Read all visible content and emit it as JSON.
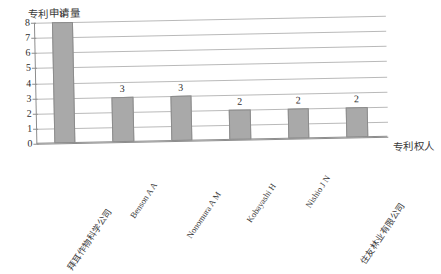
{
  "chart_data": {
    "type": "bar",
    "title": "",
    "ylabel": "专利申请量",
    "xlabel": "专利权人",
    "categories": [
      "拜耳作物科学公司",
      "Benson A A",
      "Nonomura A M",
      "Kobayashi H",
      "Nishio J N",
      "住友林业有限公司"
    ],
    "values": [
      8,
      3,
      3,
      2,
      2,
      2
    ],
    "value_labels": [
      "8",
      "3",
      "3",
      "2",
      "2",
      "2"
    ],
    "ylim": [
      0,
      8
    ],
    "yticks": [
      "0",
      "1",
      "2",
      "3",
      "4",
      "5",
      "6",
      "7",
      "8"
    ],
    "grid": true,
    "legend": "none",
    "bar_color": "#a9a9a9",
    "grid_color": "#b9b9b9",
    "axis_color": "#8d8d8d"
  }
}
